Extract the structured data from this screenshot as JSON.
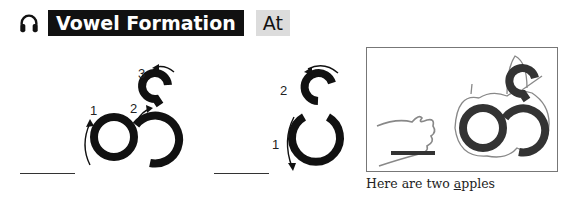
{
  "header": {
    "icon": "headphones-icon",
    "title": "Vowel Formation",
    "sound": "At"
  },
  "letters": [
    {
      "name": "letter-with-two-circles",
      "strokes": [
        {
          "order": "1",
          "direction": "up-left-side"
        },
        {
          "order": "2",
          "direction": "right-connector"
        },
        {
          "order": "3",
          "direction": "top-hook-counterclockwise"
        }
      ]
    },
    {
      "name": "letter-stacked-loops",
      "strokes": [
        {
          "order": "1",
          "direction": "down-left-side"
        },
        {
          "order": "2",
          "direction": "top-hook-counterclockwise"
        }
      ]
    }
  ],
  "picture": {
    "description": "Hand pointing at two apples shaped like the letter",
    "caption_prefix": "Here are two ",
    "caption_underlined": "a",
    "caption_suffix": "pples"
  },
  "colors": {
    "title_bg": "#111111",
    "sound_bg": "#dcdcdc",
    "stroke": "#111111",
    "sketch": "#888888"
  }
}
